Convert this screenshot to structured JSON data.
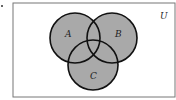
{
  "diagram": {
    "type": "venn",
    "universe_label": "U",
    "sets": [
      {
        "label": "A",
        "cx": 70,
        "cy": 36,
        "r": 21
      },
      {
        "label": "B",
        "cx": 106,
        "cy": 36,
        "r": 21
      },
      {
        "label": "C",
        "cx": 93,
        "cy": 64,
        "r": 21
      }
    ],
    "fill_color": "#a9a9a9",
    "stroke_color": "#111111",
    "shaded": "A ∪ B ∪ C"
  }
}
